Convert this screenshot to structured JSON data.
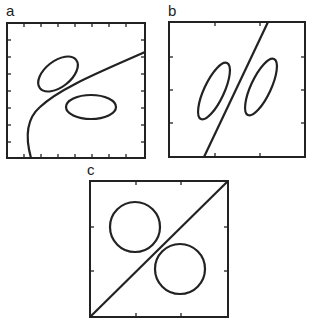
{
  "panels": [
    {
      "label": "a",
      "description": "Two ellipses separated by a curved (nonlinear) decision boundary"
    },
    {
      "label": "b",
      "description": "Two elongated tilted ellipses separated by a straight oblique line"
    },
    {
      "label": "c",
      "description": "Two circles separated by a diagonal line"
    }
  ],
  "colors": {
    "stroke": "#222222",
    "background": "#ffffff"
  }
}
